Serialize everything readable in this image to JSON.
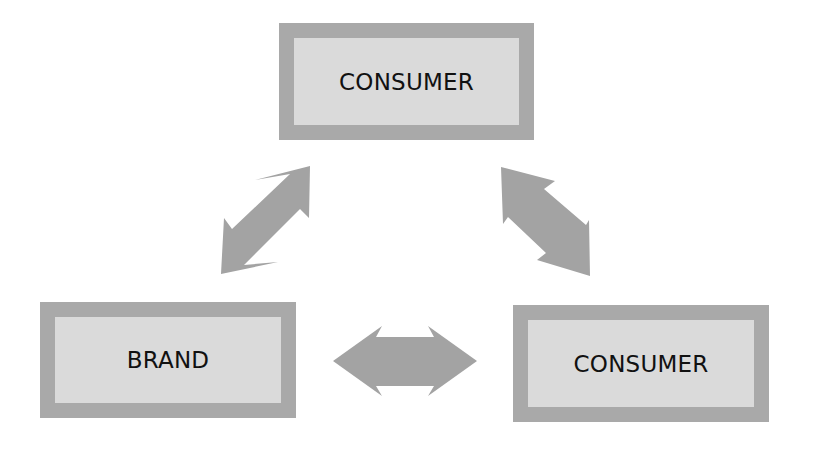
{
  "diagram": {
    "nodes": [
      {
        "id": "top",
        "label": "CONSUMER"
      },
      {
        "id": "left",
        "label": "BRAND"
      },
      {
        "id": "right",
        "label": "CONSUMER"
      }
    ],
    "edges": [
      {
        "from": "left",
        "to": "top",
        "type": "bidirectional-arrow"
      },
      {
        "from": "top",
        "to": "right",
        "type": "bidirectional-arrow"
      },
      {
        "from": "left",
        "to": "right",
        "type": "bidirectional-arrow"
      }
    ],
    "colors": {
      "node_border": "#a9a9a9",
      "node_fill": "#dadada",
      "arrow_fill": "#a3a3a3",
      "text": "#111111"
    }
  }
}
